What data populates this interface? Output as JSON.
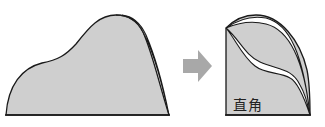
{
  "diagram": {
    "left_shape": "irregular curved shape with right edge slightly gapped",
    "arrow": "right-arrow",
    "right_shape": "shape with right-angle corner, curved cut lines",
    "label": "直角",
    "colors": {
      "fill": "#cfcfcf",
      "stroke": "#1a1a1a",
      "arrow": "#a8a8a8",
      "background": "#ffffff"
    }
  }
}
